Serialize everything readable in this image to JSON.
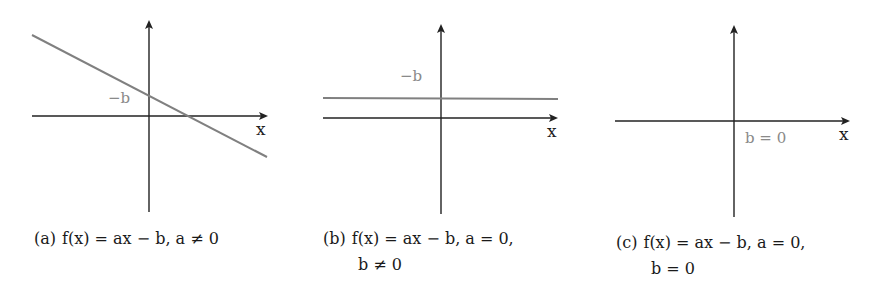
{
  "figure": {
    "panels": [
      {
        "id": "a",
        "tag": "(a)",
        "caption_line1": "f(x) = ax − b, a ≠ 0",
        "caption_line2": "",
        "intercept_label": "−b",
        "x_axis_label": "x",
        "case": "sloped line, negative slope, y-intercept −b"
      },
      {
        "id": "b",
        "tag": "(b)",
        "caption_line1": "f(x) = ax − b, a = 0,",
        "caption_line2": "b ≠ 0",
        "intercept_label": "−b",
        "x_axis_label": "x",
        "case": "horizontal line at y = −b"
      },
      {
        "id": "c",
        "tag": "(c)",
        "caption_line1": "f(x) = ax − b, a = 0,",
        "caption_line2": "b = 0",
        "intercept_label": "b = 0",
        "x_axis_label": "x",
        "case": "function coincides with x-axis"
      }
    ],
    "colors": {
      "axis": "#222222",
      "function_line": "#808080",
      "annotation": "#8a8a8a",
      "text": "#1a1a1a"
    }
  }
}
